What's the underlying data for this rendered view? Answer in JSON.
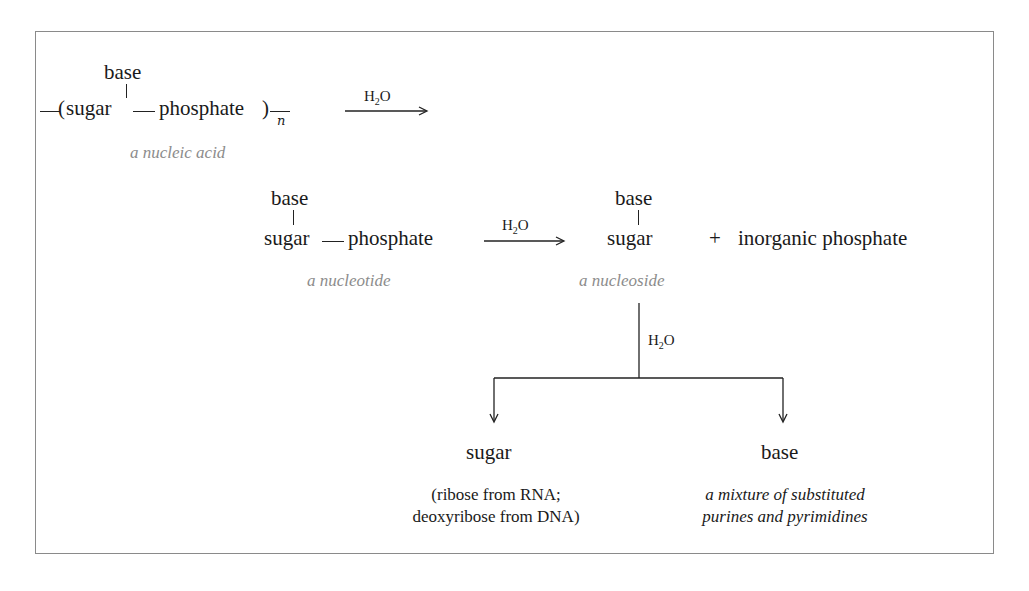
{
  "diagram": {
    "type": "reaction-scheme",
    "row1": {
      "base": "base",
      "open_paren": "(",
      "sugar": "sugar",
      "phosphate": "phosphate",
      "close_paren": ")",
      "subscript_n": "n",
      "label": "a nucleic acid",
      "arrow_reagent": "H",
      "arrow_reagent_sub": "2",
      "arrow_reagent_tail": "O"
    },
    "row2": {
      "nucleotide": {
        "base": "base",
        "sugar": "sugar",
        "phosphate": "phosphate",
        "label": "a nucleotide"
      },
      "arrow_reagent": "H",
      "arrow_reagent_sub": "2",
      "arrow_reagent_tail": "O",
      "nucleoside": {
        "base": "base",
        "sugar": "sugar",
        "label": "a nucleoside"
      },
      "plus": "+",
      "byproduct": "inorganic phosphate"
    },
    "row3": {
      "branch_reagent": "H",
      "branch_reagent_sub": "2",
      "branch_reagent_tail": "O",
      "products": [
        {
          "name": "sugar",
          "desc_line1": "(ribose from RNA;",
          "desc_line2": "deoxyribose from DNA)"
        },
        {
          "name": "base",
          "desc_line1": "a mixture of substituted",
          "desc_line2": "purines and pyrimidines"
        }
      ]
    },
    "colors": {
      "text": "#1a1a1a",
      "label": "#8c8c8c",
      "border": "#8a8a8a"
    }
  }
}
